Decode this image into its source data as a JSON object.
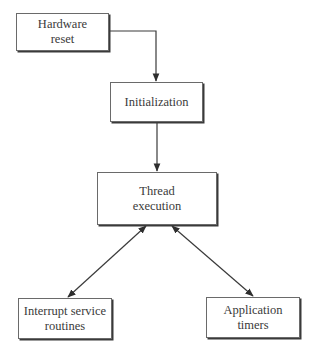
{
  "nodes": {
    "hardware_reset": {
      "line1": "Hardware",
      "line2": "reset"
    },
    "initialization": {
      "line1": "Initialization"
    },
    "thread_execution": {
      "line1": "Thread",
      "line2": "execution"
    },
    "isr": {
      "line1": "Interrupt service",
      "line2": "routines"
    },
    "app_timers": {
      "line1": "Application",
      "line2": "timers"
    }
  },
  "edges": [
    {
      "from": "hardware_reset",
      "to": "initialization",
      "type": "directed"
    },
    {
      "from": "initialization",
      "to": "thread_execution",
      "type": "directed"
    },
    {
      "from": "thread_execution",
      "to": "isr",
      "type": "bidirectional"
    },
    {
      "from": "thread_execution",
      "to": "app_timers",
      "type": "bidirectional"
    }
  ],
  "colors": {
    "line": "#3a3a3a",
    "border": "#6a6a6a",
    "text": "#3a3a3a"
  }
}
